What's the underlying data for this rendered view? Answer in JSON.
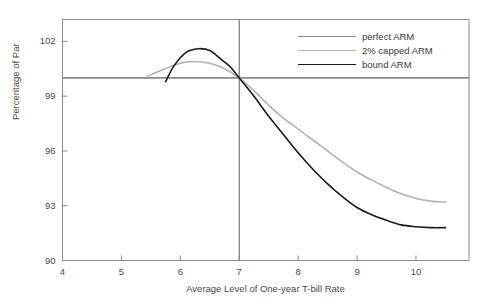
{
  "figure": {
    "title_remnant": "",
    "background": "#ffffff"
  },
  "axes": {
    "y_title": "Percentage of Par",
    "x_title": "Average Level of One-year T-bill Rate",
    "y_ticks": [
      "90",
      "93",
      "96",
      "99",
      "102"
    ],
    "x_ticks": [
      "4",
      "5",
      "6",
      "7",
      "8",
      "9",
      "10"
    ]
  },
  "legend": {
    "items": [
      {
        "label": "perfect ARM",
        "color": "#8d8d8d"
      },
      {
        "label": "2% capped ARM",
        "color": "#b3b3b3"
      },
      {
        "label": "bound ARM",
        "color": "#1a1a1a"
      }
    ]
  },
  "chart_data": {
    "type": "line",
    "title": "",
    "xlabel": "Average Level of One-year T-bill Rate",
    "ylabel": "Percentage of Par",
    "xlim": [
      4,
      10.9
    ],
    "ylim": [
      90,
      103.2
    ],
    "xticks": [
      4,
      5,
      6,
      7,
      8,
      9,
      10
    ],
    "yticks": [
      90,
      93,
      96,
      99,
      102
    ],
    "grid": false,
    "legend_position": "top-right",
    "reference_lines": [
      {
        "name": "par-line",
        "orientation": "horizontal",
        "value": 100,
        "color": "#6e6e6e"
      },
      {
        "name": "coupon-rate-line",
        "orientation": "vertical",
        "value": 7,
        "color": "#6e6e6e"
      }
    ],
    "series": [
      {
        "name": "perfect ARM",
        "color": "#8d8d8d",
        "x": [
          4.0,
          10.9
        ],
        "values": [
          100.0,
          100.0
        ]
      },
      {
        "name": "2% capped ARM",
        "color": "#b3b3b3",
        "x": [
          5.45,
          5.7,
          6.0,
          6.2,
          6.5,
          6.75,
          7.0,
          7.25,
          7.5,
          7.75,
          8.0,
          8.25,
          8.5,
          8.75,
          9.0,
          9.25,
          9.5,
          9.75,
          10.0,
          10.25,
          10.5
        ],
        "values": [
          100.1,
          100.45,
          100.8,
          100.9,
          100.8,
          100.5,
          100.0,
          99.3,
          98.5,
          97.8,
          97.2,
          96.6,
          96.0,
          95.4,
          94.85,
          94.4,
          94.0,
          93.65,
          93.4,
          93.25,
          93.2
        ]
      },
      {
        "name": "bound ARM",
        "color": "#1a1a1a",
        "x": [
          5.75,
          5.9,
          6.1,
          6.3,
          6.5,
          6.7,
          6.85,
          7.0,
          7.25,
          7.5,
          7.75,
          8.0,
          8.25,
          8.5,
          8.75,
          9.0,
          9.25,
          9.5,
          9.75,
          10.0,
          10.25,
          10.5
        ],
        "values": [
          99.8,
          100.7,
          101.4,
          101.6,
          101.5,
          101.0,
          100.6,
          100.0,
          99.0,
          97.9,
          96.9,
          95.9,
          95.0,
          94.2,
          93.5,
          92.9,
          92.5,
          92.2,
          91.95,
          91.85,
          91.8,
          91.8
        ]
      }
    ],
    "annotations": [
      {
        "text": "all three curves intersect at (7, 100)",
        "x": 7,
        "y": 100
      }
    ]
  }
}
